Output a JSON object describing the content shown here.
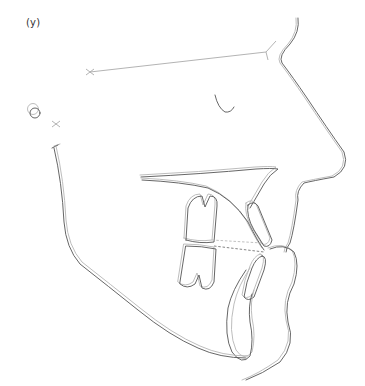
{
  "figure": {
    "panel_label": "(y)",
    "colors": {
      "tracing_dark": "#555555",
      "tracing_light": "#b5b5b5",
      "background": "#ffffff"
    },
    "landmarks": [
      {
        "name": "sella",
        "marker": "x",
        "x": 90,
        "y": 72
      },
      {
        "name": "nasion",
        "marker": "line-end",
        "x": 266,
        "y": 52
      },
      {
        "name": "porion",
        "marker": "circle",
        "x": 35,
        "y": 112
      },
      {
        "name": "basion-marker",
        "marker": "x",
        "x": 56,
        "y": 124
      }
    ]
  }
}
